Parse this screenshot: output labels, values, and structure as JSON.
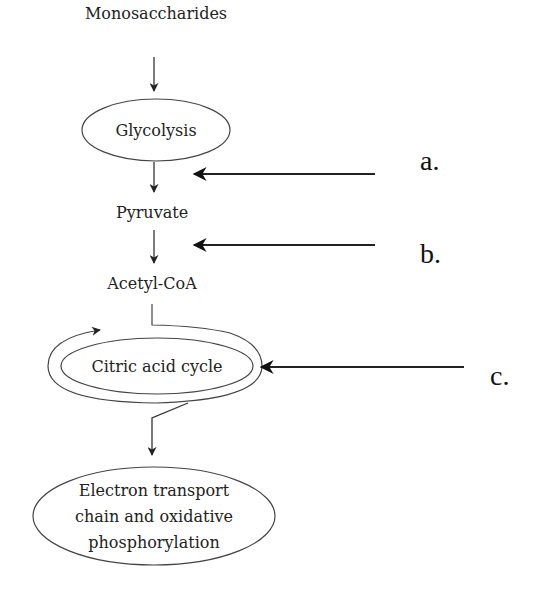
{
  "diagram": {
    "type": "flowchart",
    "colors": {
      "stroke": "#333333",
      "text": "#222222",
      "background": "#ffffff"
    },
    "nodes": {
      "monosaccharides": {
        "label": "Monosaccharides",
        "shape": "text"
      },
      "glycolysis": {
        "label": "Glycolysis",
        "shape": "ellipse"
      },
      "pyruvate": {
        "label": "Pyruvate",
        "shape": "text"
      },
      "acetyl_coa": {
        "label": "Acetyl-CoA",
        "shape": "text"
      },
      "citric_acid_cycle": {
        "label": "Citric acid cycle",
        "shape": "double-ring-ellipse"
      },
      "electron_transport": {
        "lines": [
          "Electron transport",
          "chain and oxidative",
          "phosphorylation"
        ],
        "shape": "ellipse"
      }
    },
    "edges": [
      {
        "from": "monosaccharides",
        "to": "glycolysis"
      },
      {
        "from": "glycolysis",
        "to": "pyruvate"
      },
      {
        "from": "pyruvate",
        "to": "acetyl_coa"
      },
      {
        "from": "acetyl_coa",
        "to": "citric_acid_cycle"
      },
      {
        "from": "citric_acid_cycle",
        "to": "electron_transport"
      }
    ],
    "pointers": [
      {
        "label": "a.",
        "points_to": "between glycolysis and pyruvate"
      },
      {
        "label": "b.",
        "points_to": "between pyruvate and acetyl_coa"
      },
      {
        "label": "c.",
        "points_to": "citric_acid_cycle"
      }
    ]
  }
}
